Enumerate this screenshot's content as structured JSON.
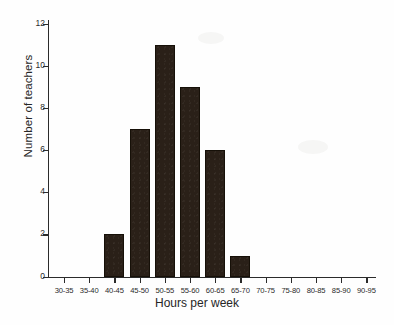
{
  "chart_data": {
    "type": "bar",
    "title": "",
    "xlabel": "Hours per week",
    "ylabel": "Number of teachers",
    "categories": [
      "30-35",
      "35-40",
      "40-45",
      "45-50",
      "50-55",
      "55-60",
      "60-65",
      "65-70",
      "70-75",
      "75-80",
      "80-85",
      "85-90",
      "90-95"
    ],
    "values": [
      0,
      0,
      2,
      7,
      11,
      9,
      6,
      1,
      0,
      0,
      0,
      0,
      0
    ],
    "ylim": [
      0,
      12
    ],
    "y_ticks": [
      0,
      2,
      4,
      6,
      8,
      10,
      12
    ],
    "y_tick_labels": [
      "0",
      "2",
      "4",
      "6",
      "8",
      "10",
      "12"
    ],
    "grid": false,
    "legend": "none",
    "bar_color": "#2a2018",
    "axis_color": "#2b2b2b",
    "background_color": "#fefefe"
  }
}
